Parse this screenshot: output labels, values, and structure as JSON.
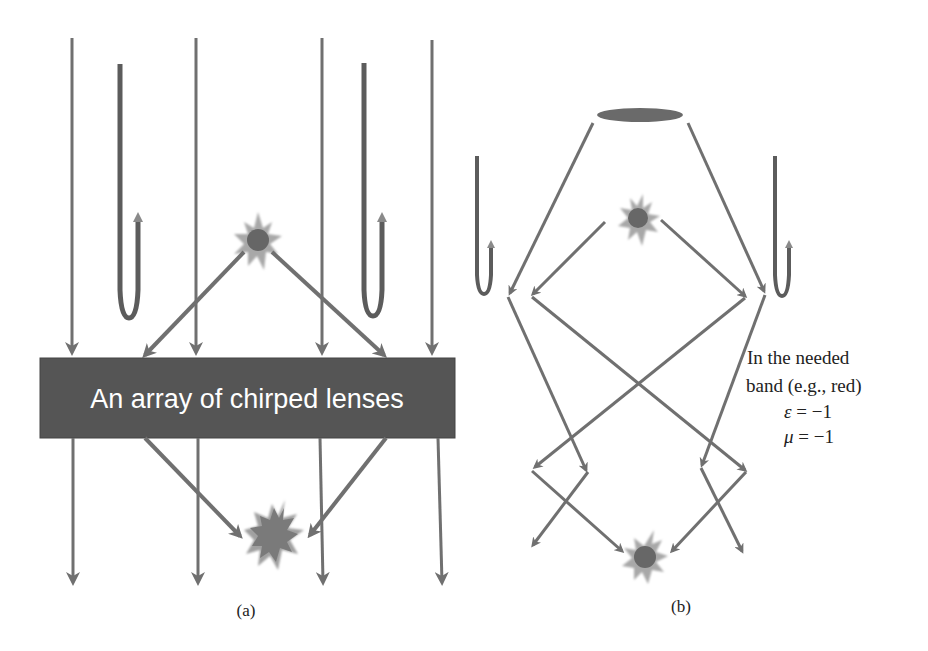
{
  "figure": {
    "colors": {
      "ray": "#707070",
      "ray_dark": "#5f5f5f",
      "lens_box": "#555555",
      "star": "#6a6a6a",
      "star_glow": "#a8a8a8",
      "u_dark": "#585858",
      "u_light": "#8a8a8a",
      "text": "#222222",
      "lens_text": "#ffffff"
    },
    "panel_a": {
      "caption": "(a)",
      "lens_label": "An array of chirped lenses"
    },
    "panel_b": {
      "caption": "(b)",
      "note_line1": "In the needed",
      "note_line2": "band (e.g., red)",
      "epsilon_symbol": "ε",
      "epsilon_value": " = −1",
      "mu_symbol": "μ",
      "mu_value": " = −1"
    }
  }
}
